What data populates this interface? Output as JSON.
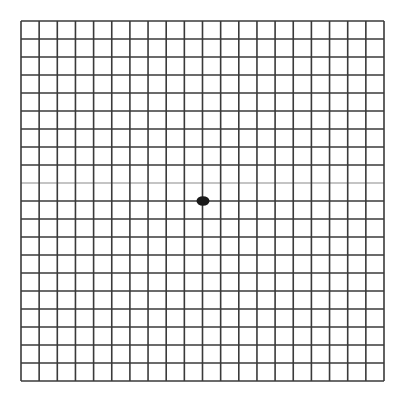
{
  "diagram": {
    "type": "amsler-grid",
    "rows": 20,
    "columns": 20,
    "left": 21,
    "top": 21,
    "right": 384,
    "bottom": 381,
    "line_color": "#3a3a3a",
    "light_line_color": "#b0b0b0",
    "light_horizontal_line_index": 9,
    "line_width": 1.6,
    "background_color": "#ffffff",
    "center_dot": {
      "cx": 203,
      "cy": 201,
      "rx": 6.5,
      "ry": 4.8,
      "color": "#1a1a1a"
    }
  }
}
